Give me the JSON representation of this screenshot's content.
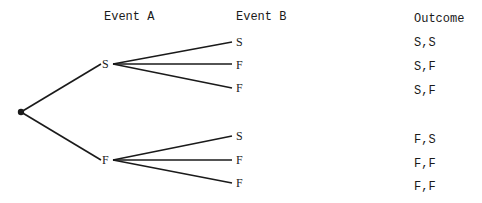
{
  "headers": {
    "event_a": "Event A",
    "event_b": "Event B",
    "outcome": "Outcome"
  },
  "tree": {
    "root": {
      "x": 21,
      "y": 112
    },
    "level1": [
      {
        "label": "S",
        "x": 107,
        "y": 64
      },
      {
        "label": "F",
        "x": 107,
        "y": 160
      }
    ],
    "level2": [
      {
        "parent": 0,
        "label": "S",
        "y": 42
      },
      {
        "parent": 0,
        "label": "F",
        "y": 64
      },
      {
        "parent": 0,
        "label": "F",
        "y": 88
      },
      {
        "parent": 1,
        "label": "S",
        "y": 136
      },
      {
        "parent": 1,
        "label": "F",
        "y": 160
      },
      {
        "parent": 1,
        "label": "F",
        "y": 183
      }
    ]
  },
  "outcomes": [
    "S,S",
    "S,F",
    "S,F",
    "F,S",
    "F,F",
    "F,F"
  ],
  "colors": {
    "line": "#1a1a1a",
    "text": "#1a1a1a",
    "background": "#ffffff"
  }
}
